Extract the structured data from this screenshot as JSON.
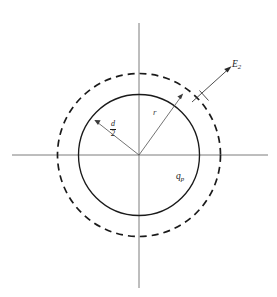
{
  "figure": {
    "background_color": "#ffffff",
    "axis_color": "#6e6e6e",
    "curve_color": "#1a1a1a",
    "leader_color": "#5a5a5a",
    "geometry": {
      "center_x": 139,
      "center_y": 155,
      "solid_circle_radius": 60.5,
      "dashed_circle_radius": 81.5,
      "axis_horizontal_x1": 12,
      "axis_horizontal_x2": 268,
      "axis_vertical_y1": 23,
      "axis_vertical_y2": 288,
      "dash_pattern": "7,5"
    }
  },
  "labels": {
    "field_vector": {
      "symbol": "E",
      "subscript": "2",
      "description": "electric-field vector at the Gaussian surface"
    },
    "radius": {
      "symbol": "r",
      "description": "radius of the spherical Gaussian surface"
    },
    "charge": {
      "symbol": "q",
      "subscript": "p",
      "description": "enclosed point charge"
    },
    "sphere_radius": {
      "numerator": "d",
      "denominator": "2",
      "description": "radius of the charged sphere, d over 2"
    }
  },
  "elements": {
    "solid_circle_name": "charged-sphere-outline",
    "dashed_circle_name": "gaussian-surface-outline",
    "horizontal_axis_name": "horizontal-axis",
    "vertical_axis_name": "vertical-axis",
    "radius_leader_name": "radius-leader-line",
    "sphere_radius_leader_name": "sphere-radius-leader-line",
    "field_arrow_name": "field-vector-arrow",
    "field_tick_name": "field-vector-tick"
  }
}
